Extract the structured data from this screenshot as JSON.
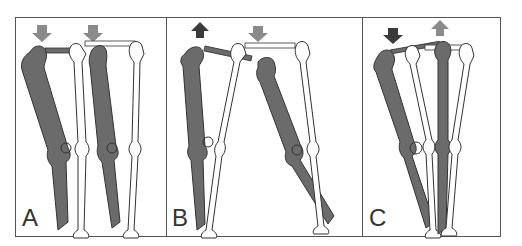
{
  "figure": {
    "panels": [
      {
        "label": "A",
        "description": "Both legs adducted; arrows pointing down on both hips"
      },
      {
        "label": "B",
        "description": "Left hip elevated (dark up arrow), right hip depressed (gray down arrow); legs spread"
      },
      {
        "label": "C",
        "description": "Left hip depressed (dark down arrow), right hip elevated (gray up arrow)"
      }
    ],
    "colors": {
      "bone_dark": "#6b6b6b",
      "bone_light": "#ffffff",
      "outline": "#333333",
      "arrow_gray": "#8a8a8a",
      "arrow_dark": "#3a3a3a",
      "border": "#555555"
    }
  }
}
